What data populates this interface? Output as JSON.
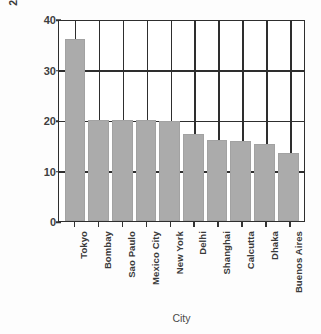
{
  "chart_data": {
    "type": "bar",
    "title": "",
    "xlabel": "City",
    "ylabel": "2010 Population in Millions",
    "categories": [
      "Tokyo",
      "Bombay",
      "Sao Paulo",
      "Mexico City",
      "New York",
      "Delhi",
      "Shanghai",
      "Calcutta",
      "Dhaka",
      "Buenos Aires"
    ],
    "values": [
      36.0,
      20.0,
      20.0,
      20.0,
      19.8,
      17.2,
      16.0,
      15.9,
      15.2,
      13.4
    ],
    "ylim": [
      0,
      40
    ],
    "yticks": [
      0,
      10,
      20,
      30,
      40
    ],
    "ytick_labels": [
      "0",
      "10",
      "20",
      "30",
      "40"
    ],
    "grid": "horizontal-and-vertical",
    "legend": "none",
    "bar_color": "#ababab",
    "axis_color": "#2e2e2e"
  },
  "axes": {
    "y_title": "2010 Population in Millions",
    "x_title": "City"
  }
}
